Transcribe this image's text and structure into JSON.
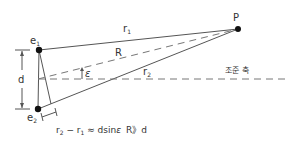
{
  "diagram": {
    "title": "",
    "colors": {
      "line": "#555555",
      "dot": "#111111",
      "text": "#333333",
      "dash": "#777777"
    },
    "points": {
      "e1": {
        "label": "e",
        "sub": "1"
      },
      "e2": {
        "label": "e",
        "sub": "2"
      },
      "P": {
        "label": "P"
      }
    },
    "labels": {
      "r1": {
        "label": "r",
        "sub": "1"
      },
      "r2": {
        "label": "r",
        "sub": "2"
      },
      "R": "R",
      "epsilon": "ε",
      "d": "d",
      "aiming_axis": "조준 축"
    },
    "formula": {
      "lhs_r2": "r",
      "lhs_r2_sub": "2",
      "minus": " − ",
      "lhs_r1": "r",
      "lhs_r1_sub": "1",
      "rhs": " ≈ dsin",
      "eps": "ε",
      "condition": "R》d"
    }
  }
}
